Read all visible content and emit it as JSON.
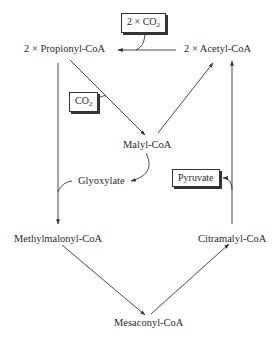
{
  "diagram": {
    "type": "metabolic-pathway",
    "nodes": {
      "propionyl": "2 × Propionyl-CoA",
      "acetyl": "2 × Acetyl-CoA",
      "malyl": "Malyl-CoA",
      "glyoxylate": "Glyoxylate",
      "methylmalonyl": "Methylmalonyl-CoA",
      "citramalyl": "Citramalyl-CoA",
      "mesaconyl": "Mesaconyl-CoA"
    },
    "cofactors": {
      "co2_top_prefix": "2 × CO",
      "co2_top_sub": "2",
      "co2_left_prefix": "CO",
      "co2_left_sub": "2",
      "pyruvate": "Pyruvate"
    },
    "edges": [
      {
        "from": "2 × Acetyl-CoA",
        "to": "2 × Propionyl-CoA",
        "input": "2 × CO2"
      },
      {
        "from": "2 × Propionyl-CoA",
        "to": "Malyl-CoA",
        "input": "CO2"
      },
      {
        "from": "Malyl-CoA",
        "to": "2 × Acetyl-CoA"
      },
      {
        "from": "Malyl-CoA",
        "to": "Glyoxylate"
      },
      {
        "from": "2 × Propionyl-CoA",
        "to": "Methylmalonyl-CoA",
        "input": "Glyoxylate"
      },
      {
        "from": "Methylmalonyl-CoA",
        "to": "Mesaconyl-CoA"
      },
      {
        "from": "Mesaconyl-CoA",
        "to": "Citramalyl-CoA"
      },
      {
        "from": "Citramalyl-CoA",
        "to": "2 × Acetyl-CoA",
        "output": "Pyruvate"
      }
    ],
    "colors": {
      "line": "#333333",
      "text": "#2b2b2b",
      "background": "#ffffff"
    }
  }
}
